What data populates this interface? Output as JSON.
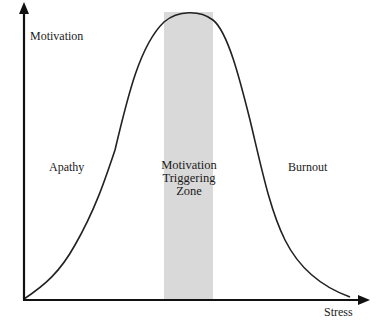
{
  "diagram": {
    "type": "bell-curve",
    "axes": {
      "y_label": "Motivation",
      "x_label": "Stress"
    },
    "regions": {
      "left": "Apathy",
      "center": [
        "Motivation",
        "Triggering",
        "Zone"
      ],
      "right": "Burnout"
    },
    "colors": {
      "axis": "#111111",
      "curve": "#222222",
      "zone_fill": "#d9d9d9"
    }
  }
}
